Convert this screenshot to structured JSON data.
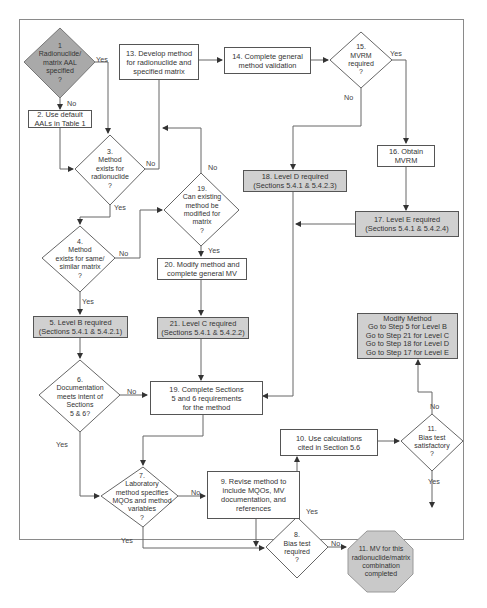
{
  "nodes": {
    "n1": {
      "lines": [
        "1",
        "Radionuclide/",
        "matrix AAL",
        "specified",
        "?"
      ]
    },
    "n2": {
      "lines": [
        "2. Use default",
        "AALs in Table 1"
      ]
    },
    "n3": {
      "lines": [
        "3.",
        "Method",
        "exists for",
        "radionuclide",
        "?"
      ]
    },
    "n4": {
      "lines": [
        "4.",
        "Method",
        "exists for same/",
        "similar matrix",
        "?"
      ]
    },
    "n5": {
      "lines": [
        "5. Level B required",
        "(Sections 5.4.1 & 5.4.2.1)"
      ]
    },
    "n6": {
      "lines": [
        "6.",
        "Documentation",
        "meets intent of",
        "Sections",
        "5 & 6?"
      ]
    },
    "n7": {
      "lines": [
        "7.",
        "Laboratory",
        "method specifies",
        "MQOs and method",
        "variables",
        "?"
      ]
    },
    "n8": {
      "lines": [
        "8.",
        "Bias test",
        "required",
        "?"
      ]
    },
    "n9": {
      "lines": [
        "9. Revise method to",
        "include MQOs, MV",
        "documentation, and",
        "references"
      ]
    },
    "n10": {
      "lines": [
        "10. Use calculations",
        "cited in Section 5.6"
      ]
    },
    "n11q": {
      "lines": [
        "11.",
        "Bias test",
        "satisfactory",
        "?"
      ]
    },
    "n11end": {
      "lines": [
        "11. MV for this",
        "radionuclide/matrix",
        "combination",
        "completed"
      ]
    },
    "n13": {
      "lines": [
        "13. Develop method",
        "for radionuclide and",
        "specified matrix"
      ]
    },
    "n14": {
      "lines": [
        "14. Complete general",
        "method validation"
      ]
    },
    "n15": {
      "lines": [
        "15.",
        "MVRM",
        "required",
        "?"
      ]
    },
    "n16": {
      "lines": [
        "16. Obtain",
        "MVRM"
      ]
    },
    "n17": {
      "lines": [
        "17. Level E required",
        "(Sections 5.4.1 & 5.4.2.4)"
      ]
    },
    "n18": {
      "lines": [
        "18. Level D required",
        "(Sections 5.4.1 & 5.4.2.3)"
      ]
    },
    "n19q": {
      "lines": [
        "19.",
        "Can existing",
        "method be",
        "modified for",
        "matrix",
        "?"
      ]
    },
    "n19box": {
      "lines": [
        "19. Complete Sections",
        "5 and 6 requirements",
        "for the method"
      ]
    },
    "n20": {
      "lines": [
        "20. Modify method and",
        "complete general MV"
      ]
    },
    "n21": {
      "lines": [
        "21. Level C required",
        "(Sections 5.4.1 & 5.4.2.2)"
      ]
    },
    "modify": {
      "lines": [
        "Modify Method",
        "Go to Step 5 for Level B",
        "Go to Step 21 for Level C",
        "Go to Step 18 for Level D",
        "Go to Step 17 for Level E"
      ]
    }
  },
  "labels": {
    "yes": "Yes",
    "no": "No"
  },
  "colors": {
    "grey_fill": "#d0d0d0",
    "line": "#555555",
    "frame": "#8a8a8a"
  }
}
